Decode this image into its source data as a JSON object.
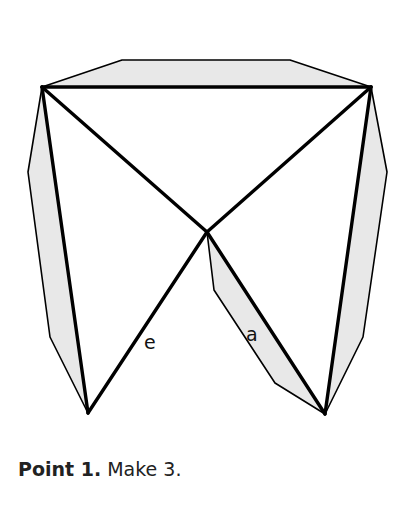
{
  "diagram": {
    "labels": {
      "edge_e": "e",
      "edge_a": "a"
    },
    "colors": {
      "fill": "#e8e8e8",
      "stroke": "#000000"
    }
  },
  "caption": {
    "bold": "Point 1.",
    "text": " Make 3."
  }
}
